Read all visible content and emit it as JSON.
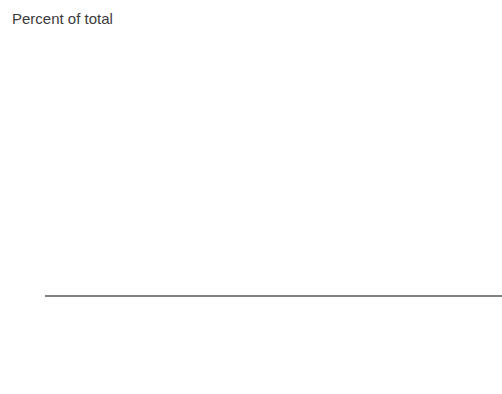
{
  "chart_data": {
    "type": "bar",
    "subtype": "stacked-bar-100",
    "title": "",
    "axis_title": "Percent of total",
    "xlabel": "",
    "ylabel": "",
    "ylim": [
      0,
      100
    ],
    "yticks": [
      0,
      20,
      40,
      60,
      80,
      100
    ],
    "grid": false,
    "legend_position": "top",
    "categories": [
      "GDP",
      "Population",
      "Portfolio liabilities",
      "Exports",
      "Imports",
      "Total trade",
      "Inward FDI",
      "Remittance inflows",
      "Tourism expenses"
    ],
    "category_lines": [
      [
        "GDP"
      ],
      [
        "Population"
      ],
      [
        "Portfolio",
        "liabilities"
      ],
      [
        "Exports"
      ],
      [
        "Imports"
      ],
      [
        "Total trade"
      ],
      [
        "Inward FDI"
      ],
      [
        "Remittance",
        "inflows"
      ],
      [
        "Tourism",
        "expenses"
      ]
    ],
    "series": [
      {
        "name": "Brazil",
        "color": "#2e3250",
        "values": [
          41,
          32,
          47,
          22,
          21,
          21,
          37,
          4,
          13
        ]
      },
      {
        "name": "Mexico",
        "color": "#f4693f",
        "values": [
          22,
          27,
          20,
          39,
          40,
          40,
          25,
          64,
          36
        ]
      },
      {
        "name": "Argentina",
        "color": "#f7a73c",
        "values": [
          9,
          8,
          4,
          6,
          6,
          6,
          5,
          0,
          9
        ]
      },
      {
        "name": "Venezuela, RB",
        "color": "#fccf2e",
        "values": [
          9,
          6,
          4,
          6,
          6,
          6,
          0,
          0,
          0
        ]
      },
      {
        "name": "Colombia",
        "color": "#75c463",
        "values": [
          6,
          9,
          4,
          4,
          5,
          4,
          5,
          7,
          7
        ]
      },
      {
        "name": "Chile",
        "color": "#79dbf2",
        "values": [
          4,
          3,
          4,
          6,
          5,
          6,
          6,
          0,
          6
        ]
      },
      {
        "name": "Others",
        "color": "#a561be",
        "values": [
          9,
          15,
          17,
          17,
          17,
          17,
          22,
          25,
          29
        ]
      }
    ]
  },
  "legend": {
    "columns": [
      {
        "items": [
          {
            "label": "Brazil",
            "color": "#2e3250"
          },
          {
            "label": "Argentina",
            "color": "#f7a73c"
          },
          {
            "label": "Colombia",
            "color": "#75c463"
          },
          {
            "label": "Others",
            "color": "#a561be"
          }
        ]
      },
      {
        "items": [
          {
            "label": "Mexico",
            "color": "#f4693f"
          },
          {
            "label": "Venezuela, RB",
            "color": "#fccf2e"
          },
          {
            "label": "Chile",
            "color": "#79dbf2"
          }
        ]
      }
    ]
  },
  "colors": {
    "text": "#3b3b3b",
    "axis": "#808080",
    "background": "#ffffff"
  }
}
